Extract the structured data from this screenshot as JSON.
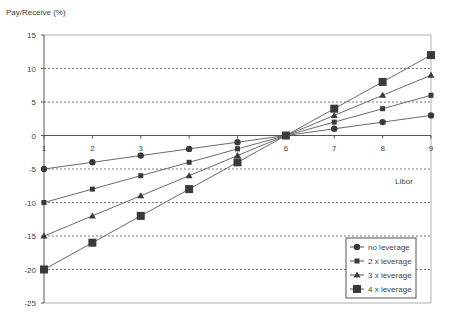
{
  "chart_data": {
    "type": "line",
    "title": "",
    "ylabel": "Pay/Receive (%)",
    "xlabel": "Libor",
    "x": [
      1,
      2,
      3,
      4,
      5,
      6,
      7,
      8,
      9
    ],
    "xlim": [
      1,
      9
    ],
    "ylim": [
      -25,
      15
    ],
    "yticks": [
      15,
      10,
      5,
      0,
      -5,
      -10,
      -15,
      -20,
      -25
    ],
    "xticks": [
      1,
      2,
      3,
      4,
      5,
      6,
      7,
      8,
      9
    ],
    "grid": "horizontal dashed",
    "legend_position": "bottom-right",
    "series": [
      {
        "name": "no leverage",
        "marker": "circle",
        "values": [
          -5,
          -4,
          -3,
          -2,
          -1,
          0,
          1,
          2,
          3
        ]
      },
      {
        "name": "2 x leverage",
        "marker": "small-square",
        "values": [
          -10,
          -8,
          -6,
          -4,
          -2,
          0,
          2,
          4,
          6
        ]
      },
      {
        "name": "3 x leverage",
        "marker": "triangle",
        "values": [
          -15,
          -12,
          -9,
          -6,
          -3,
          0,
          3,
          6,
          9
        ]
      },
      {
        "name": "4 x leverage",
        "marker": "square",
        "values": [
          -20,
          -16,
          -12,
          -8,
          -4,
          0,
          4,
          8,
          12
        ]
      }
    ]
  }
}
